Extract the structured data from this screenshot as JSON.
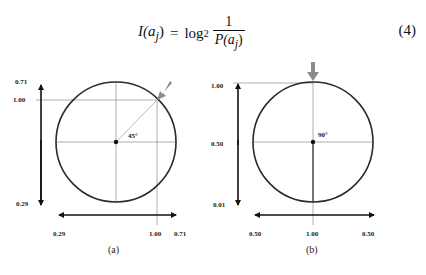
{
  "equation": {
    "lhs": "I(a",
    "lhs_sub": "j",
    "lhs_close": ")",
    "equals": "=",
    "log": "log",
    "log_base": "2",
    "numerator": "1",
    "denominator": "P(a",
    "denominator_sub": "j",
    "denominator_close": ")",
    "number": "(4)"
  },
  "figures": [
    {
      "caption": "(a)",
      "angle_label": "45°",
      "y_labels": {
        "top": "0.71",
        "mark": "1.00",
        "bottom": "0.29"
      },
      "x_labels": {
        "left": "0.29",
        "mark": "1.00",
        "right": "0.71"
      }
    },
    {
      "caption": "(b)",
      "angle_label": "90°",
      "y_labels": {
        "top": "1.00",
        "mid": "0.50",
        "bottom": "0.01"
      },
      "x_labels": {
        "left": "0.50",
        "mid": "1.00",
        "right": "0.50"
      }
    }
  ],
  "colors": {
    "circle": "#2a2a2a",
    "guide": "#9a9a9a",
    "arrow": "#8c8c8c",
    "axis": "#111111"
  }
}
